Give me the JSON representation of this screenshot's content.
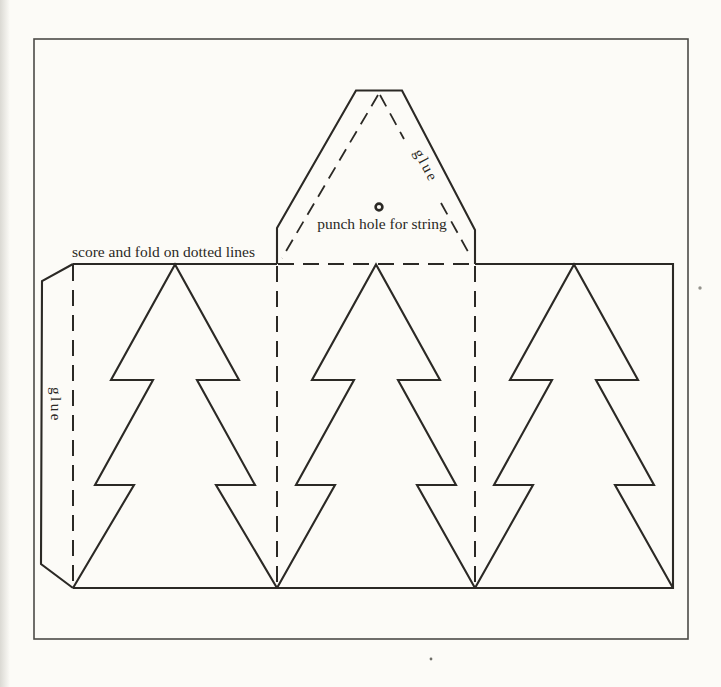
{
  "colors": {
    "paper": "#fcfbf7",
    "ink": "#2b2925",
    "page_border": "#4c4b47"
  },
  "labels": {
    "top_flap_glue": "glue",
    "punch_hole_caption": "punch hole for string",
    "fold_instruction": "score and fold on dotted lines",
    "left_tab_glue": "glue"
  },
  "markers": {
    "punch_hole": "small-ring-circle"
  }
}
